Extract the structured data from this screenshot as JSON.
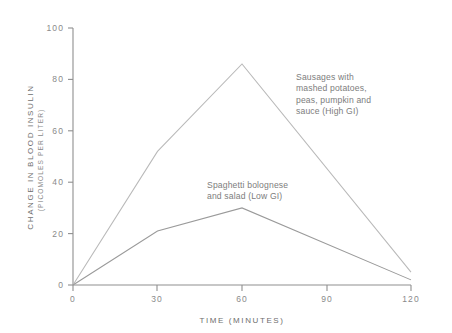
{
  "chart_data": {
    "type": "line",
    "title": "",
    "xlabel": "TIME (MINUTES)",
    "ylabel": "CHANGE IN BLOOD INSULIN",
    "ylabel_units": "(PICOMOLES PER LITER)",
    "x": [
      0,
      30,
      60,
      120
    ],
    "xlim": [
      0,
      120
    ],
    "ylim": [
      0,
      100
    ],
    "xticks": [
      "0",
      "30",
      "60",
      "90",
      "120"
    ],
    "xtick_values": [
      0,
      30,
      60,
      90,
      120
    ],
    "yticks": [
      "0",
      "20",
      "40",
      "60",
      "80",
      "100"
    ],
    "ytick_values": [
      0,
      20,
      40,
      60,
      80,
      100
    ],
    "grid": false,
    "legend_position": "inline-annotations",
    "series": [
      {
        "name": "Sausages with mashed potatoes, peas, pumpkin and sauce (High GI)",
        "short_name": "High GI",
        "color": "#b9b9b9",
        "x": [
          0,
          30,
          60,
          120
        ],
        "values": [
          0,
          52,
          86,
          5
        ]
      },
      {
        "name": "Spaghetti bolognese and salad (Low GI)",
        "short_name": "Low GI",
        "color": "#9a9a9a",
        "x": [
          0,
          30,
          60,
          120
        ],
        "values": [
          0,
          21,
          30,
          2
        ]
      }
    ],
    "annotations": [
      {
        "id": "high-gi",
        "text": "Sausages with\nmashed potatoes,\npeas, pumpkin and\nsauce (High GI)"
      },
      {
        "id": "low-gi",
        "text": "Spaghetti bolognese\nand salad (Low GI)"
      }
    ]
  },
  "axis": {
    "x_title": "TIME (MINUTES)",
    "y_title": "CHANGE IN BLOOD INSULIN",
    "y_subtitle": "(PICOMOLES PER LITER)"
  },
  "ticks": {
    "x": [
      "0",
      "30",
      "60",
      "90",
      "120"
    ],
    "y": [
      "0",
      "20",
      "40",
      "60",
      "80",
      "100"
    ]
  },
  "colors": {
    "background": "#ffffff",
    "axis": "#8f8f8f",
    "tick_text": "#8a8a8a",
    "annotation_text": "#7d7d7d",
    "series_high_gi": "#b9b9b9",
    "series_low_gi": "#9a9a9a"
  }
}
